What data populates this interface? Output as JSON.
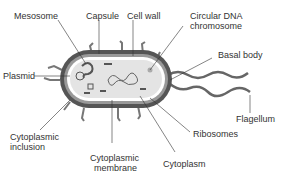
{
  "diagram": {
    "labels": {
      "mesosome": "Mesosome",
      "capsule": "Capsule",
      "cell_wall": "Cell wall",
      "circular_dna_1": "Circular DNA",
      "circular_dna_2": "chromosome",
      "basal_body": "Basal body",
      "plasmid": "Plasmid",
      "flagellum": "Flagellum",
      "cyto_inclusion_1": "Cytoplasmic",
      "cyto_inclusion_2": "inclusion",
      "cyto_membrane_1": "Cytoplasmic",
      "cyto_membrane_2": "membrane",
      "ribosomes": "Ribosomes",
      "cytoplasm": "Cytoplasm"
    },
    "colors": {
      "capsule": "#555555",
      "cell_wall": "#8a8a8a",
      "cytoplasm": "#e6e6e6",
      "line": "#333333"
    }
  }
}
